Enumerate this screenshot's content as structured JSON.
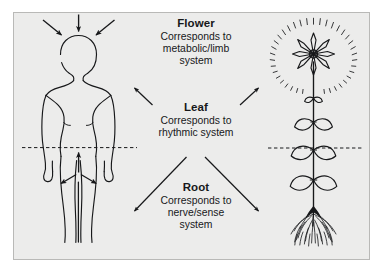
{
  "figure": {
    "type": "diagram",
    "background_color": "#ececeb",
    "page_color": "#ffffff",
    "ink_color": "#17181a",
    "border_color": "#b9b9b7"
  },
  "blocks": [
    {
      "id": "flower",
      "heading": "Flower",
      "lines": [
        "Corresponds to",
        "metabolic/limb",
        "system"
      ],
      "arrow_direction": "diverging-up",
      "maps_to_human_region": "head",
      "maps_to_plant_region": "flower"
    },
    {
      "id": "leaf",
      "heading": "Leaf",
      "lines": [
        "Corresponds to",
        "rhythmic system"
      ],
      "arrow_direction": "up-left-and-up-right",
      "maps_to_human_region": "chest",
      "maps_to_plant_region": "leaves"
    },
    {
      "id": "root",
      "heading": "Root",
      "lines": [
        "Corresponds to",
        "nerve/sense",
        "system"
      ],
      "arrow_direction": "down-left-and-down-right",
      "maps_to_human_region": "limbs",
      "maps_to_plant_region": "roots"
    }
  ],
  "left_figure": {
    "name": "human-figure",
    "description": "outline drawing of a standing human seen from the front",
    "arrows_at_head": {
      "count": 3,
      "direction": "converging inward toward the head"
    },
    "arrows_at_pelvis": {
      "count": 3,
      "direction": "radiating outward from the pelvis"
    },
    "midline": "horizontal dashed line at the hip level"
  },
  "right_figure": {
    "name": "plant-figure",
    "description": "outline drawing of a flowering plant with stem, paired leaves and fibrous roots",
    "flower": {
      "petals": 8,
      "halo": "radiating dashes around the blossom"
    },
    "leaf_pairs": 3,
    "roots": "dense fibrous root mass",
    "midline": "horizontal dashed line at the leaf level"
  }
}
